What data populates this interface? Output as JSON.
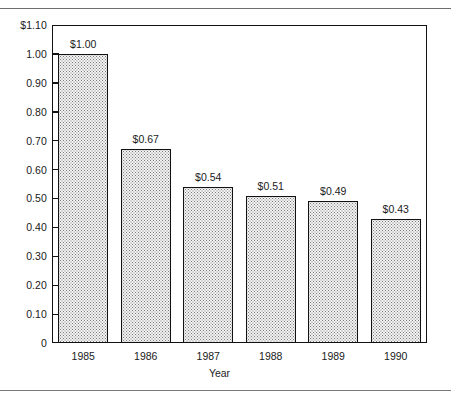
{
  "page": {
    "rules": [
      "top-rule",
      "bottom-rule"
    ]
  },
  "chart_data": {
    "type": "bar",
    "title": "",
    "xlabel": "Year",
    "ylabel": "",
    "categories": [
      "1985",
      "1986",
      "1987",
      "1988",
      "1989",
      "1990"
    ],
    "values": [
      1.0,
      0.67,
      0.54,
      0.51,
      0.49,
      0.43
    ],
    "data_labels": [
      "$1.00",
      "$0.67",
      "$0.54",
      "$0.51",
      "$0.49",
      "$0.43"
    ],
    "ylim": [
      0,
      1.1
    ],
    "ytick_values": [
      1.1,
      1.0,
      0.9,
      0.8,
      0.7,
      0.6,
      0.5,
      0.4,
      0.3,
      0.2,
      0.1,
      0
    ],
    "ytick_labels": [
      "$1.10",
      "1.00",
      "0.90",
      "0.80",
      "0.70",
      "0.60",
      "0.50",
      "0.40",
      "0.30",
      "0.20",
      "0.10",
      "0"
    ],
    "grid": false,
    "legend": null,
    "legend_position": "none",
    "bar_fill": "#f2f2f2",
    "bar_edge": "#111111",
    "bar_pattern": "fine-dotted-halftone",
    "frame_color": "#111111",
    "background": "#ffffff"
  }
}
